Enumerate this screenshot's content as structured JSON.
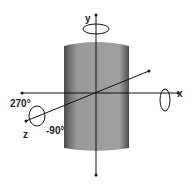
{
  "diagram": {
    "type": "3D rotation axes on cylinder",
    "labels": {
      "y_axis": "y",
      "x_axis": "x",
      "z_axis": "z",
      "angle_positive": "270°",
      "angle_negative": "-90°"
    },
    "colors": {
      "cylinder_body": "#9a9a9a",
      "cylinder_edge": "#4a4a4a",
      "axis": "#111111"
    }
  }
}
